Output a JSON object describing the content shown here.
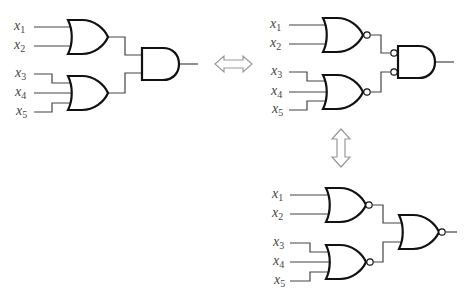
{
  "colors": {
    "gate_stroke": "#111111",
    "wire": "#444444",
    "arrow": "#999999",
    "label": "#444444"
  },
  "circuits": [
    {
      "id": "or-and",
      "description": "Two OR gates feeding an AND gate",
      "inputs": [
        {
          "var": "x",
          "sub": "1"
        },
        {
          "var": "x",
          "sub": "2"
        },
        {
          "var": "x",
          "sub": "3"
        },
        {
          "var": "x",
          "sub": "4"
        },
        {
          "var": "x",
          "sub": "5"
        }
      ],
      "gates": [
        "OR(x1,x2)",
        "OR(x3,x4,x5)",
        "AND"
      ]
    },
    {
      "id": "nor-and-inverted-inputs",
      "description": "Two NOR gates feeding an AND gate with inverted inputs",
      "inputs": [
        {
          "var": "x",
          "sub": "1"
        },
        {
          "var": "x",
          "sub": "2"
        },
        {
          "var": "x",
          "sub": "3"
        },
        {
          "var": "x",
          "sub": "4"
        },
        {
          "var": "x",
          "sub": "5"
        }
      ],
      "gates": [
        "NOR(x1,x2)",
        "NOR(x3,x4,x5)",
        "AND with bubbled inputs"
      ]
    },
    {
      "id": "nor-nor",
      "description": "Two NOR gates feeding a NOR gate",
      "inputs": [
        {
          "var": "x",
          "sub": "1"
        },
        {
          "var": "x",
          "sub": "2"
        },
        {
          "var": "x",
          "sub": "3"
        },
        {
          "var": "x",
          "sub": "4"
        },
        {
          "var": "x",
          "sub": "5"
        }
      ],
      "gates": [
        "NOR(x1,x2)",
        "NOR(x3,x4,x5)",
        "NOR"
      ]
    }
  ],
  "arrows": [
    {
      "id": "equiv-horizontal",
      "meaning": "equivalent"
    },
    {
      "id": "equiv-vertical",
      "meaning": "equivalent"
    }
  ]
}
